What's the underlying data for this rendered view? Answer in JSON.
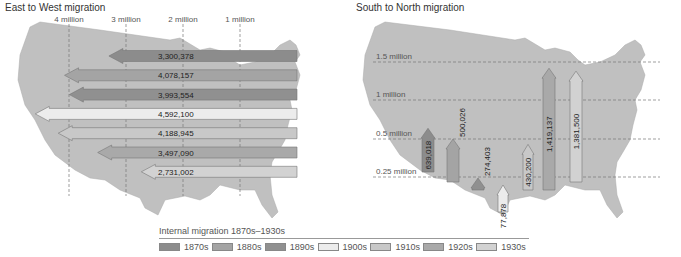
{
  "chart_data": [
    {
      "type": "bar",
      "orientation": "horizontal",
      "title": "East to West migration",
      "axis_ticks": [
        "4 million",
        "3 million",
        "2 million",
        "1 million"
      ],
      "axis_tick_values": [
        4000000,
        3000000,
        2000000,
        1000000
      ],
      "xlim": [
        5000000,
        0
      ],
      "grid": true,
      "categories": [
        "1870s",
        "1880s",
        "1890s",
        "1900s",
        "1910s",
        "1920s",
        "1930s"
      ],
      "values": [
        3300378,
        4078157,
        3993554,
        4592100,
        4188945,
        3497090,
        2731002
      ],
      "value_labels": [
        "3,300,378",
        "4,078,157",
        "3,993,554",
        "4,592,100",
        "4,188,945",
        "3,497,090",
        "2,731,002"
      ]
    },
    {
      "type": "bar",
      "orientation": "vertical",
      "title": "South to North migration",
      "axis_ticks": [
        "1.5 million",
        "1 million",
        "0.5 million",
        "0.25 million"
      ],
      "axis_tick_values": [
        1500000,
        1000000,
        500000,
        250000
      ],
      "grid": true,
      "categories": [
        "1870s",
        "1880s",
        "1890s",
        "1900s",
        "1910s",
        "1920s",
        "1930s"
      ],
      "values": [
        639018,
        500026,
        274403,
        77878,
        430200,
        1419137,
        1381500
      ],
      "value_labels": [
        "639,018",
        "500,026",
        "274,403",
        "77,878",
        "430,200",
        "1,419,137",
        "1,381,500"
      ]
    }
  ],
  "legend": {
    "title": "Internal migration 1870s–1930s",
    "items": [
      {
        "label": "1870s",
        "color": "#8c8c8c"
      },
      {
        "label": "1880s",
        "color": "#a4a4a4"
      },
      {
        "label": "1890s",
        "color": "#909090"
      },
      {
        "label": "1900s",
        "color": "#ececec"
      },
      {
        "label": "1910s",
        "color": "#c8c8c8"
      },
      {
        "label": "1920s",
        "color": "#a9a9a9"
      },
      {
        "label": "1930s",
        "color": "#d2d2d2"
      }
    ]
  },
  "map_color": "#c0c0c0"
}
